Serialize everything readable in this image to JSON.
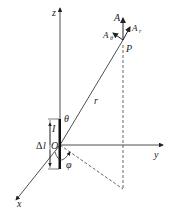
{
  "diagram": {
    "title": "",
    "axes": {
      "z": "z",
      "y": "y",
      "x": "x"
    },
    "origin": "O",
    "point": "P",
    "radius": "r",
    "theta": "θ",
    "phi": "φ",
    "current": "I",
    "element_length_prefix": "Δ",
    "element_length_var": "l",
    "vector": "A",
    "component_r": "A",
    "component_r_sub": "r",
    "component_theta": "A",
    "component_theta_sub": "θ",
    "colors": {
      "line": "#222222",
      "background": "#ffffff"
    }
  }
}
